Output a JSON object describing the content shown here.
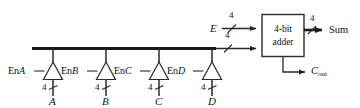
{
  "figure": {
    "type": "logic-circuit-diagram",
    "colors": {
      "ink": "#111111",
      "background": "#ffffff",
      "bus": "#1a1a1a",
      "wire": "#333333"
    }
  },
  "bus": {
    "width_label": "4"
  },
  "buffers": [
    {
      "enable_label_prefix": "En",
      "enable_label_signal": "A",
      "input_label": "A",
      "width_label": "4"
    },
    {
      "enable_label_prefix": "En",
      "enable_label_signal": "B",
      "input_label": "B",
      "width_label": "4"
    },
    {
      "enable_label_prefix": "En",
      "enable_label_signal": "C",
      "input_label": "C",
      "width_label": "4"
    },
    {
      "enable_label_prefix": "En",
      "enable_label_signal": "D",
      "input_label": "D",
      "width_label": "4"
    }
  ],
  "adder": {
    "line1": "4-bit",
    "line2": "adder",
    "input_e_label": "E",
    "input_e_width": "4",
    "input_bus_width": "4",
    "output_sum_label": "Sum",
    "output_sum_width": "4",
    "output_carry_label": "C",
    "output_carry_subscript": "out"
  }
}
